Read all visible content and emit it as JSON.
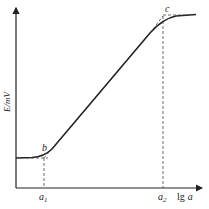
{
  "diagram": {
    "type": "potentiometric-calibration-curve",
    "y_axis": {
      "label": "E/mV"
    },
    "x_axis": {
      "label_prefix": "lg",
      "label_var": "a"
    },
    "points": {
      "b": {
        "label": "b"
      },
      "c": {
        "label": "c"
      }
    },
    "x_markers": [
      {
        "label": "a",
        "subscript": "1"
      },
      {
        "label": "a",
        "subscript": "2"
      }
    ],
    "colors": {
      "stroke": "#222222",
      "dashed": "#444444",
      "background": "#ffffff"
    }
  }
}
